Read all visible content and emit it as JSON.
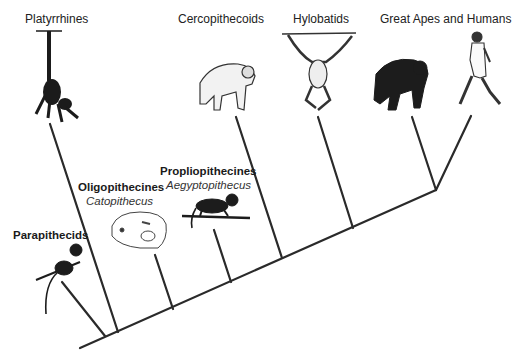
{
  "diagram": {
    "type": "cladogram",
    "taxa": [
      {
        "id": "platyrrhines",
        "name": "Platyrrhines",
        "genus": null,
        "illustration": "spider-monkey-hanging"
      },
      {
        "id": "cercopithecoids",
        "name": "Cercopithecoids",
        "genus": null,
        "illustration": "baboon-walking"
      },
      {
        "id": "hylobatids",
        "name": "Hylobatids",
        "genus": null,
        "illustration": "gibbon-hanging"
      },
      {
        "id": "great-apes-humans",
        "name": "Great Apes and Humans",
        "genus": null,
        "illustration": "chimpanzee-and-human"
      },
      {
        "id": "parapithecids",
        "name": "Parapithecids",
        "genus": null,
        "illustration": "small-monkey-on-branch"
      },
      {
        "id": "oligopithecines",
        "name": "Oligopithecines",
        "genus": "Catopithecus",
        "illustration": "skull"
      },
      {
        "id": "propliopithecines",
        "name": "Propliopithecines",
        "genus": "Aegyptopithecus",
        "illustration": "monkey-on-branch"
      }
    ],
    "branch_order_from_root": [
      "Parapithecids",
      "Platyrrhines",
      "Oligopithecines",
      "Propliopithecines",
      "Cercopithecoids",
      "Hylobatids",
      "Great Apes",
      "Humans"
    ]
  }
}
